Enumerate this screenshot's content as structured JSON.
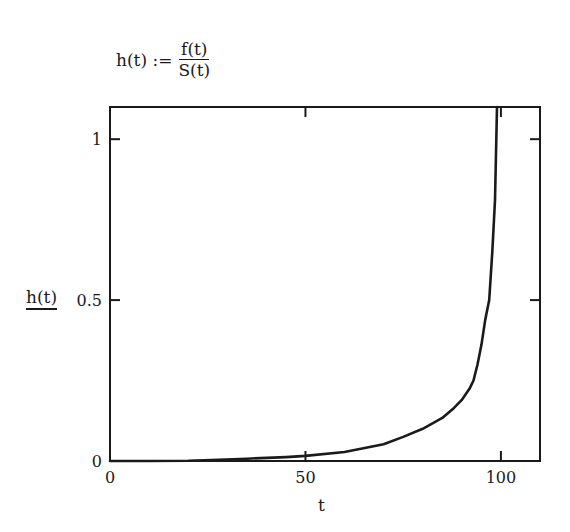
{
  "formula": {
    "lhs": "h(t) :=",
    "numerator": "f(t)",
    "denominator": "S(t)"
  },
  "chart_data": {
    "type": "line",
    "title": "",
    "xlabel": "t",
    "ylabel": "h(t)",
    "xlim": [
      0,
      110
    ],
    "ylim": [
      0,
      1.1
    ],
    "grid": false,
    "legend": null,
    "x_ticks": [
      0,
      50,
      100
    ],
    "x_tick_labels": [
      "0",
      "50",
      "100"
    ],
    "y_ticks": [
      0,
      0.5,
      1
    ],
    "y_tick_labels": [
      "0",
      "0.5",
      "1"
    ],
    "series": [
      {
        "name": "h(t)",
        "color": "#1a1a1a",
        "x": [
          0,
          10,
          20,
          26,
          35,
          45,
          50,
          60,
          70,
          75,
          80,
          85,
          88,
          90,
          92,
          93,
          94,
          95,
          96,
          97,
          97.8,
          98.5,
          99
        ],
        "y": [
          0.0,
          0.0,
          0.001,
          0.003,
          0.007,
          0.012,
          0.016,
          0.028,
          0.052,
          0.075,
          0.1,
          0.134,
          0.165,
          0.19,
          0.225,
          0.25,
          0.3,
          0.36,
          0.44,
          0.5,
          0.65,
          0.81,
          1.1
        ]
      }
    ]
  }
}
